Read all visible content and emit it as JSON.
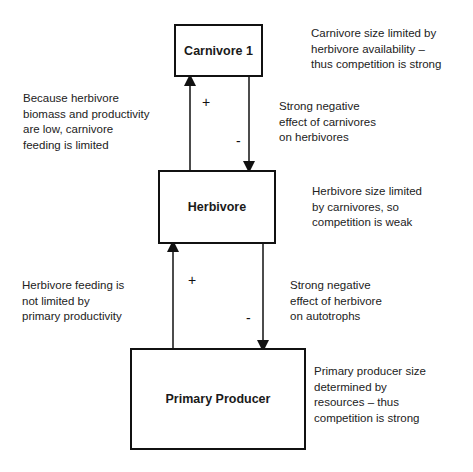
{
  "nodes": {
    "carnivore": {
      "label": "Carnivore 1"
    },
    "herbivore": {
      "label": "Herbivore"
    },
    "producer": {
      "label": "Primary Producer"
    }
  },
  "notes": {
    "carnivore_right": "Carnivore size limited by\nherbivore availability –\nthus competition is strong",
    "upper_left": "Because herbivore\nbiomass and productivity\nare low, carnivore\nfeeding is limited",
    "upper_right": "Strong negative\neffect of carnivores\non herbivores",
    "herbivore_right": "Herbivore size limited\nby carnivores, so\ncompetition is weak",
    "lower_left": "Herbivore feeding is\nnot limited by\nprimary productivity",
    "lower_right": "Strong negative\neffect of herbivore\non autotrophs",
    "producer_right": "Primary producer size\ndetermined by\nresources – thus\ncompetition is strong"
  },
  "edges": {
    "herbivore_to_carnivore": {
      "sign": "+"
    },
    "carnivore_to_herbivore": {
      "sign": "-"
    },
    "producer_to_herbivore": {
      "sign": "+"
    },
    "herbivore_to_producer": {
      "sign": "-"
    }
  }
}
